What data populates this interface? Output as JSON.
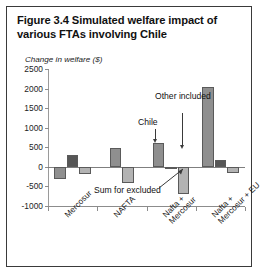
{
  "figure": {
    "title": "Figure 3.4  Simulated welfare impact of various FTAs involving Chile",
    "y_axis_title": "Change in welfare ($)"
  },
  "annotations": {
    "chile": "Chile",
    "other_included": "Other included",
    "sum_for_excluded": "Sum for excluded"
  },
  "chart_data": {
    "type": "bar",
    "title": "Figure 3.4  Simulated welfare impact of various FTAs involving Chile",
    "xlabel": "",
    "ylabel": "Change in welfare ($)",
    "ylim": [
      -1000,
      2500
    ],
    "yticks": [
      -1000,
      -500,
      0,
      500,
      1000,
      1500,
      2000,
      2500
    ],
    "ytick_labels": [
      "-1000",
      "-500",
      "0",
      "500",
      "1000",
      "1500",
      "2000",
      "2500"
    ],
    "grid": false,
    "legend": "none",
    "categories": [
      "Mercosur",
      "NAFTA",
      "Nafta + Mercosur",
      "Nafta + Mercosur + EU"
    ],
    "series": [
      {
        "name": "Chile",
        "color": "#8f8f8f",
        "values": [
          -320,
          480,
          600,
          2050
        ]
      },
      {
        "name": "Other included",
        "color": "#565656",
        "values": [
          300,
          null,
          -60,
          185
        ]
      },
      {
        "name": "Sum for excluded",
        "color": "#b3b3b3",
        "values": [
          -180,
          -420,
          -700,
          -160
        ]
      }
    ]
  }
}
